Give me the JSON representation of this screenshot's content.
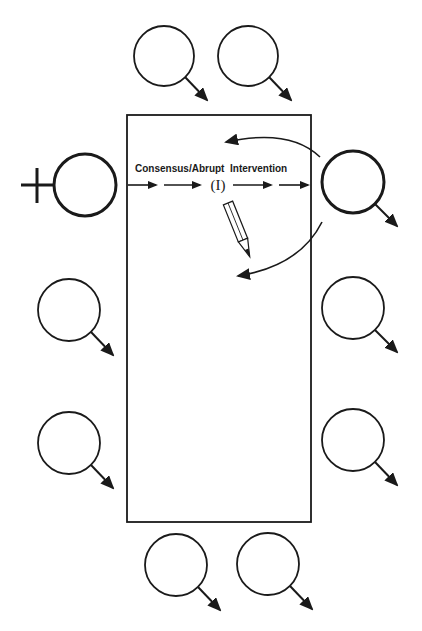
{
  "diagram": {
    "title": "",
    "table": {
      "shape": "rectangle",
      "x": 127,
      "y": 115,
      "width": 184,
      "height": 407
    },
    "labels": {
      "process": "Consensus/Abrupt  Intervention",
      "marker": "(I)"
    },
    "participants": [
      {
        "id": "top-1",
        "cx": 164,
        "cy": 56,
        "r": 30,
        "symbol": "male",
        "highlight": false
      },
      {
        "id": "top-2",
        "cx": 248,
        "cy": 56,
        "r": 30,
        "symbol": "male",
        "highlight": false
      },
      {
        "id": "left-female",
        "cx": 85,
        "cy": 185,
        "r": 31,
        "symbol": "female",
        "highlight": true
      },
      {
        "id": "right-male",
        "cx": 353,
        "cy": 182,
        "r": 31,
        "symbol": "male",
        "highlight": true
      },
      {
        "id": "left-2",
        "cx": 69,
        "cy": 310,
        "r": 31,
        "symbol": "male",
        "highlight": false
      },
      {
        "id": "left-3",
        "cx": 69,
        "cy": 443,
        "r": 31,
        "symbol": "male",
        "highlight": false
      },
      {
        "id": "right-2",
        "cx": 353,
        "cy": 308,
        "r": 31,
        "symbol": "male",
        "highlight": false
      },
      {
        "id": "right-3",
        "cx": 353,
        "cy": 440,
        "r": 31,
        "symbol": "male",
        "highlight": false
      },
      {
        "id": "bottom-1",
        "cx": 176,
        "cy": 565,
        "r": 31,
        "symbol": "male",
        "highlight": false
      },
      {
        "id": "bottom-2",
        "cx": 268,
        "cy": 564,
        "r": 31,
        "symbol": "male",
        "highlight": false
      }
    ],
    "flow_arrows_count": 4,
    "curved_arrows_count": 2,
    "icons": [
      "pencil-icon",
      "female-symbol-icon",
      "male-symbol-icon"
    ],
    "colors": {
      "stroke": "#1a1a1a",
      "background": "#ffffff"
    }
  }
}
